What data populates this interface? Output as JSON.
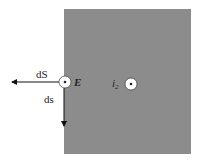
{
  "diagram": {
    "plate": {
      "x": 64,
      "y": 9,
      "width": 127,
      "height": 145,
      "color": "#8c8c8c"
    },
    "labels": {
      "dS": "dS",
      "ds": "ds",
      "E": "E",
      "i2_main": "i",
      "i2_sub": "2"
    },
    "points": [
      {
        "name": "E",
        "x": 65,
        "y": 83,
        "symbol": "out-of-page"
      },
      {
        "name": "i2",
        "x": 131,
        "y": 84,
        "symbol": "out-of-page"
      }
    ],
    "arrows": [
      {
        "name": "dS",
        "direction": "left"
      },
      {
        "name": "ds",
        "direction": "down"
      }
    ]
  }
}
